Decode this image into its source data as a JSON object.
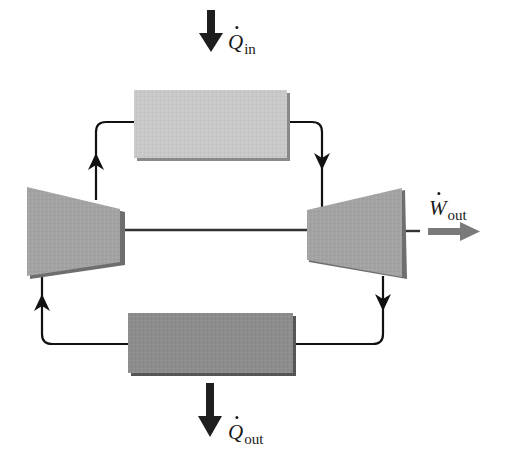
{
  "diagram": {
    "type": "power-cycle-schematic",
    "colors": {
      "line": "#111111",
      "heat_arrow": "#1e1e1e",
      "heater_box": "#c9c9c9",
      "cooler_box": "#8d8d8d",
      "machine": "#a2a2a2",
      "machine_shadow": "#6e6e6e",
      "work_arrow": "#7a7a7a"
    },
    "components": {
      "heater": {
        "name": "heat-addition-box"
      },
      "cooler": {
        "name": "heat-rejection-box"
      },
      "compressor": {
        "name": "compressor"
      },
      "turbine": {
        "name": "turbine"
      }
    },
    "labels": {
      "q_in": {
        "symbol": "Q",
        "subscript": "in"
      },
      "q_out": {
        "symbol": "Q",
        "subscript": "out"
      },
      "w_out": {
        "symbol": "W",
        "subscript": "out"
      }
    }
  }
}
